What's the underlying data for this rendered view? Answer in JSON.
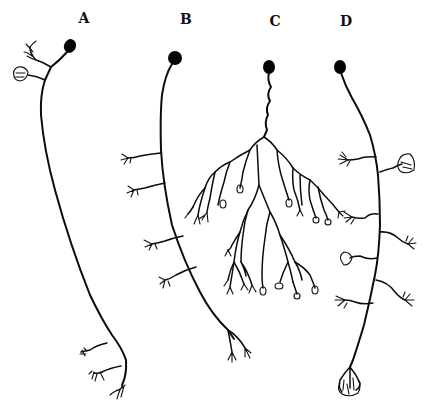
{
  "figure": {
    "background": "#ffffff",
    "ink_color": "#0c0c0c",
    "panels": [
      {
        "label": "A",
        "label_pos": [
          84,
          18
        ],
        "description": "neuron with soma at top, two terminal arbors near soma, long axon descending to three terminal branches",
        "soma": [
          70,
          46
        ]
      },
      {
        "label": "B",
        "label_pos": [
          186,
          19
        ],
        "description": "neuron with soma at top, axon descending with four lateral branches on left side and bifurcating terminal",
        "soma": [
          175,
          58
        ]
      },
      {
        "label": "C",
        "label_pos": [
          275,
          21
        ],
        "description": "neuron with wavy axon descending into a large dendritic/terminal tree with many branched endings",
        "soma": [
          269,
          67
        ]
      },
      {
        "label": "D",
        "label_pos": [
          346,
          21
        ],
        "description": "neuron with soma at top, axon descending with paired lateral branches on both sides ending in arborizations, terminal tuft at bottom",
        "soma": [
          340,
          67
        ]
      }
    ]
  }
}
